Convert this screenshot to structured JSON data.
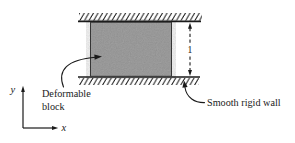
{
  "figure": {
    "background": "#ffffff",
    "ink_color": "#1a1a1a",
    "block": {
      "label_line1": "Deformable",
      "label_line2": "block",
      "fill": "#a8a8a8",
      "outline": "#3c3c3c"
    },
    "walls": {
      "label": "Smooth rigid wall"
    },
    "dimension": {
      "label": "1"
    },
    "axes": {
      "x_label": "x",
      "y_label": "y"
    }
  }
}
